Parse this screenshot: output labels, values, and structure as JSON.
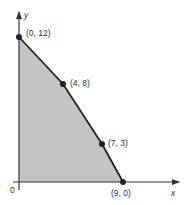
{
  "diagram": {
    "type": "feasible-region",
    "axes": {
      "x_label": "x",
      "y_label": "y",
      "origin_label": "0"
    },
    "points": [
      {
        "label": "(0, 12)",
        "x": 0,
        "y": 12
      },
      {
        "label": "(4, 8)",
        "x": 4,
        "y": 8
      },
      {
        "label": "(7, 3)",
        "x": 7,
        "y": 3
      },
      {
        "label": "(9, 0)",
        "x": 9,
        "y": 0
      }
    ],
    "colors": {
      "region_fill": "#c4c4c4",
      "line": "#222222",
      "background": "#ffffff"
    }
  }
}
